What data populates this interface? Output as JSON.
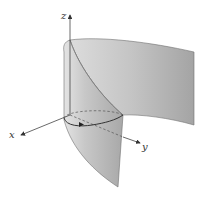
{
  "figure": {
    "axes": {
      "x_label": "x",
      "y_label": "y",
      "z_label": "z"
    },
    "colors": {
      "surface_light": "#e2e2e2",
      "surface_mid": "#bdbdbd",
      "surface_dark": "#9a9a9a",
      "edge": "#6e6e6e",
      "axis": "#444444",
      "curve": "#333333",
      "background": "#ffffff"
    }
  }
}
